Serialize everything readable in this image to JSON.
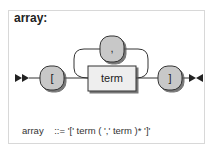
{
  "rule": {
    "name": "array",
    "title": "array:",
    "definition_name": "array",
    "definition_op": "::=",
    "definition_body": "'[' term ( ',' term )* ']'"
  },
  "diagram": {
    "terminals": [
      {
        "id": "open-bracket",
        "label": "["
      },
      {
        "id": "comma",
        "label": ","
      },
      {
        "id": "close-bracket",
        "label": "]"
      }
    ],
    "nonterminals": [
      {
        "id": "term",
        "label": "term"
      }
    ],
    "colors": {
      "terminal_fill": "#c8c8c8",
      "nonterminal_fill": "#eeeeee",
      "stroke": "#333333",
      "line": "#333333",
      "shadow": "#555555"
    }
  }
}
